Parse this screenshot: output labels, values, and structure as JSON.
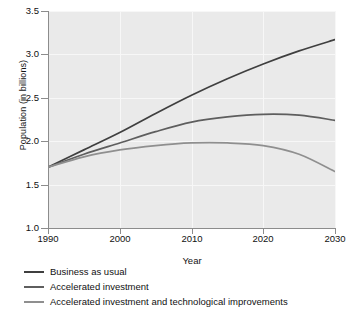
{
  "chart_data": {
    "type": "line",
    "title": "",
    "xlabel": "Year",
    "ylabel": "Population (in billions)",
    "xlim": [
      1990,
      2030
    ],
    "ylim": [
      1.0,
      3.5
    ],
    "xticks": [
      "1990",
      "2000",
      "2010",
      "2020",
      "2030"
    ],
    "yticks": [
      "1.0",
      "1.5",
      "2.0",
      "2.5",
      "3.0",
      "3.5"
    ],
    "grid": true,
    "legend_position": "below",
    "x": [
      1990,
      1995,
      2000,
      2005,
      2010,
      2015,
      2020,
      2025,
      2030
    ],
    "series": [
      {
        "name": "Business as usual",
        "color": "#3f3f3f",
        "values": [
          1.7,
          1.9,
          2.1,
          2.32,
          2.53,
          2.72,
          2.89,
          3.04,
          3.17
        ]
      },
      {
        "name": "Accelerated investment",
        "color": "#5e5e5e",
        "values": [
          1.7,
          1.85,
          1.98,
          2.11,
          2.22,
          2.28,
          2.31,
          2.3,
          2.24
        ]
      },
      {
        "name": "Accelerated investment and technological improvements",
        "color": "#8f8f8f",
        "values": [
          1.7,
          1.82,
          1.9,
          1.95,
          1.98,
          1.98,
          1.95,
          1.85,
          1.65
        ]
      }
    ],
    "colors": {
      "plot_background": "#eaeaea",
      "gridline": "#f7f7f7",
      "axis": "#8c8c8c",
      "text": "#111111"
    }
  }
}
